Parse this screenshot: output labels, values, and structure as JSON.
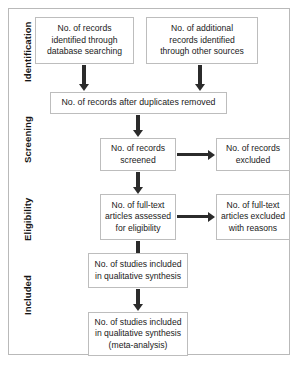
{
  "diagram": {
    "type": "flowchart",
    "stages": [
      {
        "id": "identification",
        "label": "Identification"
      },
      {
        "id": "screening",
        "label": "Screening"
      },
      {
        "id": "eligibility",
        "label": "Eligibility"
      },
      {
        "id": "included",
        "label": "Included"
      }
    ],
    "nodes": [
      {
        "id": "records-identified-database",
        "text": "No. of records\nidentified through\ndatabase searching"
      },
      {
        "id": "records-identified-other-sources",
        "text": "No. of additional\nrecords identified\nthrough other sources"
      },
      {
        "id": "records-after-duplicates-removed",
        "text": "No. of records after duplicates removed"
      },
      {
        "id": "records-screened",
        "text": "No. of records\nscreened"
      },
      {
        "id": "records-excluded",
        "text": "No. of records\nexcluded"
      },
      {
        "id": "full-text-articles-assessed",
        "text": "No. of full-text\narticles assessed\nfor eligibility"
      },
      {
        "id": "full-text-articles-excluded",
        "text": "No. of full-text\narticles excluded\nwith reasons"
      },
      {
        "id": "studies-qualitative-synthesis",
        "text": "No. of studies included\nin qualitative synthesis"
      },
      {
        "id": "studies-meta-analysis",
        "text": "No. of studies included\nin qualitative synthesis\n(meta-analysis)"
      }
    ],
    "colors": {
      "frame_border": "#b9b9b9",
      "node_border": "#bdbdbd",
      "arrow": "#2b2b2b",
      "text": "#1a1a1a",
      "background": "#ffffff"
    }
  }
}
